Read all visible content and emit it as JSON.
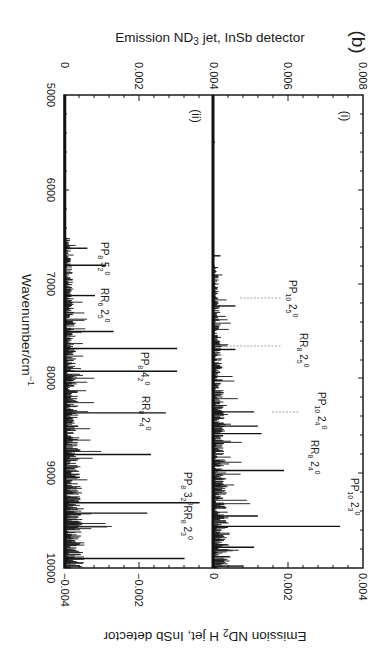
{
  "figure_label": "(b)",
  "panel_labels": [
    "(i)",
    "(ii)"
  ],
  "top_axis": {
    "label": "Emission ND3 jet, InSb detector",
    "label_parts": {
      "pre": "Emission ND",
      "sub": "3",
      "post": " jet, InSb detector"
    },
    "ticks": [
      "0",
      "0.002",
      "0.004",
      "0.006",
      "0.008"
    ]
  },
  "bottom_axis": {
    "label": "Emission ND2 H jet, InSb detector",
    "label_parts": {
      "pre": "Emission ND",
      "sub": "2",
      "post": " H jet, InSb detector"
    },
    "ticks": [
      "−0.004",
      "−0.002",
      "0",
      "0.002",
      "0.004"
    ]
  },
  "wavenumber_axis": {
    "label": "Wavenumber/cm−1",
    "label_parts": {
      "pre": "Wavenumber/cm",
      "sup": "−1"
    },
    "ticks": [
      "5000",
      "6000",
      "7000",
      "8000",
      "9000",
      "10000"
    ]
  },
  "annotations_i": [
    {
      "text": "PP10 25 0",
      "main": "PP",
      "sub1": "10",
      "mid": " 2",
      "sub2": "5",
      "sup": "0",
      "wn": 7230,
      "dashed": true
    },
    {
      "text": "RR8 25 0",
      "main": "RR",
      "sub1": "8",
      "mid": " 2",
      "sub2": "5",
      "sup": "0",
      "wn": 7690,
      "dashed": true
    },
    {
      "text": "PP10 24 0",
      "main": "PP",
      "sub1": "10",
      "mid": " 2",
      "sub2": "4",
      "sup": "0",
      "wn": 8580,
      "dashed": true
    },
    {
      "text": "RR8 24 0",
      "main": "RR",
      "sub1": "8",
      "mid": " 2",
      "sub2": "4",
      "sup": "0",
      "wn": 8970,
      "dashed": false
    },
    {
      "text": "PP10 23 0",
      "main": "PP",
      "sub1": "10",
      "mid": " 2",
      "sub2": "3",
      "sup": "0",
      "wn": 9560,
      "dashed": false
    }
  ],
  "annotations_ii": [
    {
      "text": "PP8 52 0",
      "main": "PP",
      "sub1": "8",
      "mid": " 5",
      "sub2": "2",
      "sup": "0",
      "wn": 6800
    },
    {
      "text": "RR6 25 0",
      "main": "RR",
      "sub1": "6",
      "mid": " 2",
      "sub2": "5",
      "sup": "0",
      "wn": 7130
    },
    {
      "text": "PP8 42 0",
      "main": "PP",
      "sub1": "8",
      "mid": " 4",
      "sub2": "2",
      "sup": "0",
      "wn": 7920
    },
    {
      "text": "RR8 24 0",
      "main": "RR",
      "sub1": "8",
      "mid": " 2",
      "sub2": "4",
      "sup": "0",
      "wn": 8360
    },
    {
      "text": "PP8 32 0 RR8 23 0",
      "main": "PP",
      "sub1": "8",
      "mid": " 3",
      "sub2": "2",
      "sup": "0",
      "extra": "RR8 23 0",
      "wn": 9320
    }
  ],
  "chart_data": [
    {
      "type": "line",
      "title": "(b)(i) Emission ND3 jet, InSb detector",
      "xlabel": "Wavenumber/cm−1",
      "ylabel": "Emission ND3 jet, InSb detector",
      "xlim": [
        5000,
        10000
      ],
      "ylim": [
        0,
        0.008
      ],
      "orientation": "rotated 90° (wavenumber vertical, intensity horizontal)",
      "x_ticks": [
        5000,
        6000,
        7000,
        8000,
        9000,
        10000
      ],
      "y_ticks": [
        0.004,
        0.006,
        0.008
      ],
      "panel_zero_offset": 0.004,
      "peaks": [
        {
          "wavenumber": 5500,
          "intensity": 5e-05
        },
        {
          "wavenumber": 6700,
          "intensity": 0.0002
        },
        {
          "wavenumber": 7230,
          "intensity": 0.0006,
          "label": "PP10 25 0"
        },
        {
          "wavenumber": 7690,
          "intensity": 0.0006,
          "label": "RR8 25 0"
        },
        {
          "wavenumber": 8350,
          "intensity": 0.0011
        },
        {
          "wavenumber": 8500,
          "intensity": 0.0012
        },
        {
          "wavenumber": 8580,
          "intensity": 0.0013,
          "label": "PP10 24 0"
        },
        {
          "wavenumber": 8970,
          "intensity": 0.0019,
          "label": "RR8 24 0"
        },
        {
          "wavenumber": 9450,
          "intensity": 0.0012
        },
        {
          "wavenumber": 9560,
          "intensity": 0.0034,
          "label": "PP10 23 0"
        },
        {
          "wavenumber": 9780,
          "intensity": 0.0011
        },
        {
          "wavenumber": 9980,
          "intensity": 0.0008
        }
      ],
      "annotations": [
        "PP10 25 0",
        "RR8 25 0",
        "PP10 24 0",
        "RR8 24 0",
        "PP10 23 0"
      ],
      "panel_label": "(i)"
    },
    {
      "type": "line",
      "title": "(b)(ii) Emission ND2 H jet, InSb detector",
      "xlabel": "Wavenumber/cm−1",
      "ylabel": "Emission ND2 H jet, InSb detector",
      "xlim": [
        5000,
        10000
      ],
      "ylim": [
        -0.004,
        0
      ],
      "orientation": "rotated 90° (wavenumber vertical, intensity horizontal, peaks pointing negative)",
      "x_ticks": [
        5000,
        6000,
        7000,
        8000,
        9000,
        10000
      ],
      "y_ticks": [
        -0.004,
        -0.002,
        0
      ],
      "peaks": [
        {
          "wavenumber": 6620,
          "intensity": -0.0006
        },
        {
          "wavenumber": 6800,
          "intensity": -0.0011,
          "label": "PP8 52 0"
        },
        {
          "wavenumber": 7120,
          "intensity": -0.0008,
          "label": "RR6 25 0"
        },
        {
          "wavenumber": 7500,
          "intensity": -0.0013
        },
        {
          "wavenumber": 7680,
          "intensity": -0.003
        },
        {
          "wavenumber": 7920,
          "intensity": -0.003,
          "label": "PP8 42 0"
        },
        {
          "wavenumber": 8360,
          "intensity": -0.0027,
          "label": "RR8 24 0"
        },
        {
          "wavenumber": 8800,
          "intensity": -0.0023
        },
        {
          "wavenumber": 9310,
          "intensity": -0.0036,
          "label": "PP8 32 0 / RR8 23 0"
        },
        {
          "wavenumber": 9420,
          "intensity": -0.0022
        },
        {
          "wavenumber": 9900,
          "intensity": -0.0032
        }
      ],
      "annotations": [
        "PP8 52 0",
        "RR6 25 0",
        "PP8 42 0",
        "RR8 24 0",
        "PP8 32 0 RR8 23 0"
      ],
      "panel_label": "(ii)"
    }
  ]
}
